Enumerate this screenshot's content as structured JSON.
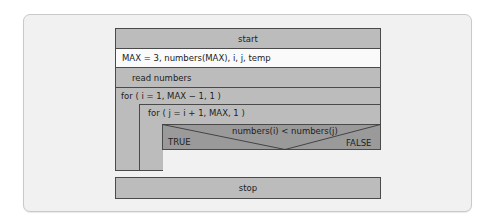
{
  "diagram": {
    "type": "nassi-shneiderman",
    "start": "start",
    "declaration": "MAX = 3, numbers(MAX), i, j, temp",
    "read": "read numbers",
    "outer_loop": "for ( i = 1, MAX − 1, 1 )",
    "inner_loop": "for ( j = i + 1, MAX, 1 )",
    "decision": {
      "condition": "numbers(i) < numbers(j)",
      "true_label": "TRUE",
      "false_label": "FALSE"
    },
    "stop": "stop"
  },
  "colors": {
    "block_gray": "#bcbcbc",
    "block_white": "#fafafa",
    "decision_gray": "#9a9a9a",
    "border": "#4a4a4a",
    "frame_bg": "#f1f1f1"
  }
}
